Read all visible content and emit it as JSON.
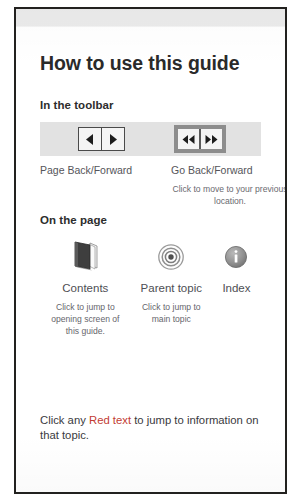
{
  "page": {
    "title": "How to use this guide"
  },
  "toolbar_section": {
    "heading": "In the toolbar",
    "buttons": [
      {
        "group": "page-back-forward",
        "label": "Page Back/Forward",
        "icons": [
          "triangle-left-icon",
          "triangle-right-icon"
        ],
        "note": ""
      },
      {
        "group": "go-back-forward",
        "label": "Go Back/Forward",
        "icons": [
          "double-triangle-left-icon",
          "double-triangle-right-icon"
        ],
        "note": "Click to move to your previous location."
      }
    ]
  },
  "onpage_section": {
    "heading": "On the page",
    "items": [
      {
        "icon": "book-icon",
        "label": "Contents",
        "note": "Click to jump to opening screen of this guide."
      },
      {
        "icon": "target-icon",
        "label": "Parent topic",
        "note": "Click to jump to main topic"
      },
      {
        "icon": "info-icon",
        "label": "Index",
        "note": ""
      }
    ]
  },
  "footer": {
    "prefix": "Click any ",
    "highlight": "Red text",
    "suffix": " to jump to information on that topic."
  },
  "colors": {
    "red_link": "#c23b32",
    "toolbar_strip": "#e2e2e2",
    "selected_frame": "#8d8d8d",
    "page_border": "#22211f"
  }
}
